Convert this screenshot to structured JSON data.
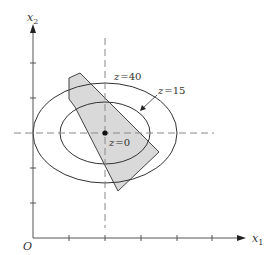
{
  "diagram": {
    "type": "contour_plot_with_feasible_region",
    "axes": {
      "x_label": "x",
      "x_sub": "1",
      "y_label": "x",
      "y_sub": "2",
      "origin_label": "O"
    },
    "contours": [
      {
        "label": "z = 40",
        "label_var": "z",
        "label_eq": "=",
        "label_val": "40"
      },
      {
        "label": "z = 15",
        "label_var": "z",
        "label_eq": "=",
        "label_val": "15"
      },
      {
        "label": "z = 0",
        "label_var": "z",
        "label_eq": "=",
        "label_val": "0"
      }
    ],
    "colors": {
      "line": "#333333",
      "dashed": "#777777",
      "region_fill": "#d9d9d9",
      "region_stroke": "#444444"
    }
  }
}
